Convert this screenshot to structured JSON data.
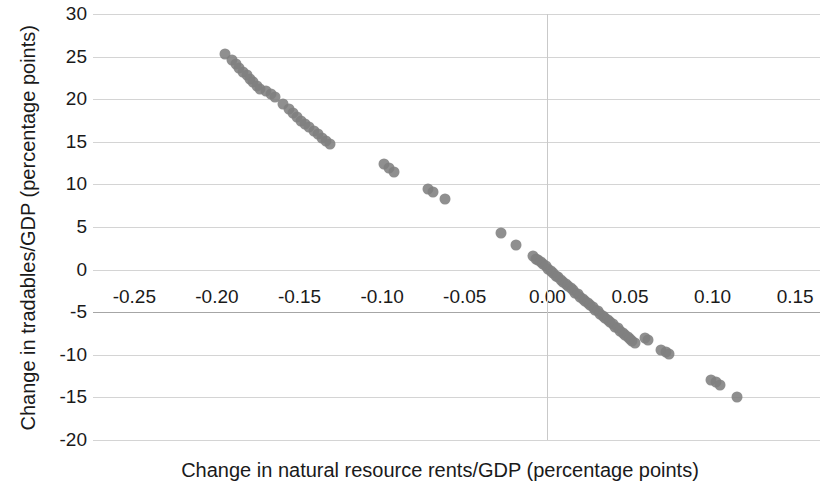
{
  "chart_data": {
    "type": "scatter",
    "title": "",
    "xlabel": "Change in natural resource rents/GDP (percentage points)",
    "ylabel": "Change in tradables/GDP (percentage points)",
    "xlim": [
      -0.275,
      0.165
    ],
    "ylim": [
      -20,
      30
    ],
    "xticks": [
      -0.25,
      -0.2,
      -0.15,
      -0.1,
      -0.05,
      0.0,
      0.05,
      0.1,
      0.15
    ],
    "xticklabels": [
      "-0.25",
      "-0.20",
      "-0.15",
      "-0.10",
      "-0.05",
      "0.00",
      "0.05",
      "0.10",
      "0.15"
    ],
    "yticks": [
      30,
      25,
      20,
      15,
      10,
      5,
      0,
      -5,
      -10,
      -15,
      -20
    ],
    "yticklabels": [
      "30",
      "25",
      "20",
      "15",
      "10",
      "5",
      "0",
      "-5",
      "-10",
      "-15",
      "-20"
    ],
    "grid": "horizontal",
    "legend": "none",
    "marker_color": "#808080",
    "marker_size": 11,
    "series": [
      {
        "name": "countries",
        "points": [
          [
            -0.195,
            25.3
          ],
          [
            -0.191,
            24.6
          ],
          [
            -0.1885,
            24.1
          ],
          [
            -0.1865,
            23.7
          ],
          [
            -0.184,
            23.2
          ],
          [
            -0.182,
            22.8
          ],
          [
            -0.18,
            22.4
          ],
          [
            -0.178,
            22.0
          ],
          [
            -0.176,
            21.6
          ],
          [
            -0.174,
            21.2
          ],
          [
            -0.17,
            21.0
          ],
          [
            -0.1675,
            20.6
          ],
          [
            -0.165,
            20.2
          ],
          [
            -0.16,
            19.4
          ],
          [
            -0.1565,
            18.8
          ],
          [
            -0.154,
            18.4
          ],
          [
            -0.1515,
            17.9
          ],
          [
            -0.149,
            17.5
          ],
          [
            -0.1465,
            17.1
          ],
          [
            -0.144,
            16.7
          ],
          [
            -0.1415,
            16.3
          ],
          [
            -0.139,
            15.9
          ],
          [
            -0.1365,
            15.5
          ],
          [
            -0.134,
            15.1
          ],
          [
            -0.1315,
            14.7
          ],
          [
            -0.099,
            12.4
          ],
          [
            -0.096,
            11.9
          ],
          [
            -0.093,
            11.4
          ],
          [
            -0.072,
            9.5
          ],
          [
            -0.069,
            9.1
          ],
          [
            -0.062,
            8.3
          ],
          [
            -0.028,
            4.3
          ],
          [
            -0.019,
            2.9
          ],
          [
            -0.0085,
            1.6
          ],
          [
            -0.007,
            1.3
          ],
          [
            -0.0055,
            1.1
          ],
          [
            -0.004,
            0.9
          ],
          [
            -0.0025,
            0.6
          ],
          [
            -0.001,
            0.4
          ],
          [
            0.0005,
            0.1
          ],
          [
            0.002,
            -0.2
          ],
          [
            0.0035,
            -0.4
          ],
          [
            0.005,
            -0.7
          ],
          [
            0.0065,
            -0.9
          ],
          [
            0.008,
            -1.2
          ],
          [
            0.0095,
            -1.4
          ],
          [
            0.011,
            -1.7
          ],
          [
            0.0125,
            -1.9
          ],
          [
            0.014,
            -2.2
          ],
          [
            0.0155,
            -2.4
          ],
          [
            0.017,
            -2.7
          ],
          [
            0.0185,
            -2.9
          ],
          [
            0.02,
            -3.2
          ],
          [
            0.0215,
            -3.4
          ],
          [
            0.023,
            -3.7
          ],
          [
            0.0245,
            -3.9
          ],
          [
            0.026,
            -4.2
          ],
          [
            0.0275,
            -4.4
          ],
          [
            0.029,
            -4.7
          ],
          [
            0.0305,
            -4.9
          ],
          [
            0.032,
            -5.2
          ],
          [
            0.0335,
            -5.4
          ],
          [
            0.035,
            -5.7
          ],
          [
            0.0365,
            -5.9
          ],
          [
            0.038,
            -6.2
          ],
          [
            0.0395,
            -6.4
          ],
          [
            0.041,
            -6.7
          ],
          [
            0.0425,
            -6.9
          ],
          [
            0.044,
            -7.2
          ],
          [
            0.0455,
            -7.4
          ],
          [
            0.047,
            -7.7
          ],
          [
            0.0485,
            -7.9
          ],
          [
            0.05,
            -8.2
          ],
          [
            0.0515,
            -8.4
          ],
          [
            0.053,
            -8.6
          ],
          [
            0.059,
            -8.0
          ],
          [
            0.061,
            -8.3
          ],
          [
            0.069,
            -9.4
          ],
          [
            0.072,
            -9.7
          ],
          [
            0.0735,
            -9.9
          ],
          [
            0.099,
            -12.9
          ],
          [
            0.102,
            -13.2
          ],
          [
            0.1045,
            -13.5
          ],
          [
            0.115,
            -14.9
          ]
        ]
      }
    ]
  },
  "axis": {
    "ylabel": "Change in tradables/GDP (percentage\npoints)",
    "ylabel_line1": "Change in tradables/GDP (percentage",
    "ylabel_line2": "points)",
    "xlabel": "Change in natural resource rents/GDP (percentage points)"
  }
}
